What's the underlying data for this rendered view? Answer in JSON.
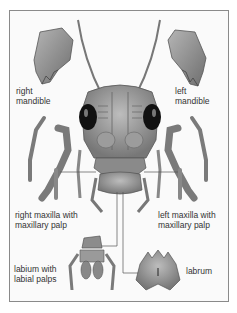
{
  "diagram": {
    "labels": {
      "right_mandible": [
        "right",
        "mandible"
      ],
      "left_mandible": [
        "left",
        "mandible"
      ],
      "right_maxilla": [
        "right maxilla with",
        "maxillary palp"
      ],
      "left_maxilla": [
        "left maxilla with",
        "maxillary palp"
      ],
      "labium": [
        "labium with",
        "labial palps"
      ],
      "labrum": [
        "labrum"
      ]
    },
    "colors": {
      "frame_border": "#8a8a8a",
      "part_fill": "#8c8c8c",
      "part_dark": "#4a4a4a",
      "eye": "#111111",
      "leader_line": "#555555"
    }
  }
}
